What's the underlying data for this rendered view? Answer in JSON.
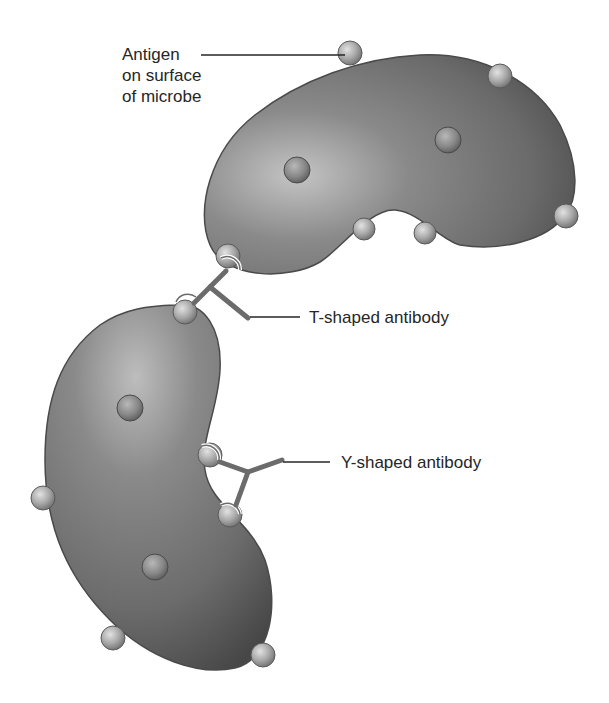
{
  "figure": {
    "background": "#ffffff",
    "colors": {
      "microbe_body": "#6f6f6f",
      "microbe_highlight": "#b5b5b5",
      "microbe_shadow": "#3e3e3e",
      "microbe_outline": "#4a4a4a",
      "antigen": "#a6a6a6",
      "antibody": "#6b6b6b",
      "leader_line": "#262626",
      "text": "#262626"
    }
  },
  "labels": {
    "antigen": "Antigen\non surface\nof microbe",
    "t_antibody": "T-shaped antibody",
    "y_antibody": "Y-shaped antibody"
  },
  "components": {
    "microbes": [
      {
        "name": "upper microbe",
        "position": "top-right",
        "surface_antigens": 6,
        "interior_antigens": 2
      },
      {
        "name": "lower microbe",
        "position": "bottom-left",
        "surface_antigens": 5,
        "interior_antigens": 2
      }
    ],
    "antibodies": [
      {
        "type": "T-shaped",
        "binds": "upper microbe and lower microbe"
      },
      {
        "type": "Y-shaped",
        "binds": "lower microbe (two antigens)"
      }
    ]
  }
}
